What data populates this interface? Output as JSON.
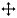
{
  "icon": {
    "name": "move-cursor-icon",
    "color": "#000000",
    "outline": "#ffffff",
    "background": "#ffffff"
  }
}
